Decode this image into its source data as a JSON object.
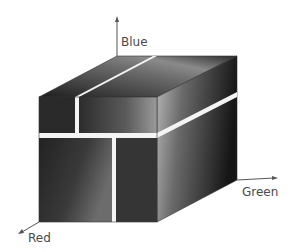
{
  "axes": {
    "blue": {
      "label": "Blue"
    },
    "green": {
      "label": "Green"
    },
    "red": {
      "label": "Red"
    }
  },
  "colors": {
    "axis_line": "#555555",
    "label_text": "#4a4a4a",
    "gap": "#f4f4f4"
  }
}
